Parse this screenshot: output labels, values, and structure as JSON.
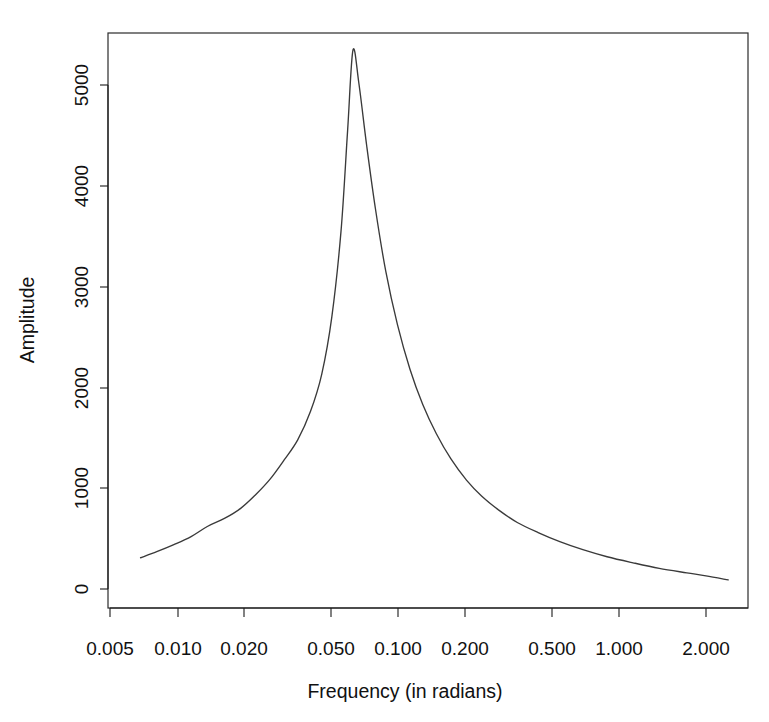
{
  "chart_data": {
    "type": "line",
    "title": "",
    "xlabel": "Frequency (in radians)",
    "ylabel": "Amplitude",
    "xscale": "log",
    "yscale": "linear",
    "grid": false,
    "legend": null,
    "xlim": [
      0.0045,
      2.6
    ],
    "ylim": [
      0,
      5400
    ],
    "xticks": [
      0.005,
      0.01,
      0.02,
      0.05,
      0.1,
      0.2,
      0.5,
      1.0,
      2.0
    ],
    "xticklabels": [
      "0.005",
      "0.010",
      "0.020",
      "0.050",
      "0.100",
      "0.200",
      "0.500",
      "1.000",
      "2.000"
    ],
    "yticks": [
      0,
      1000,
      2000,
      3000,
      4000,
      5000
    ],
    "yticklabels": [
      "0",
      "1000",
      "2000",
      "3000",
      "4000",
      "5000"
    ],
    "series": [
      {
        "name": "spectrum",
        "color": "#3a3a3a",
        "x": [
          0.0068,
          0.008,
          0.0095,
          0.0113,
          0.0133,
          0.0158,
          0.0186,
          0.0215,
          0.025,
          0.0288,
          0.033,
          0.0375,
          0.042,
          0.0465,
          0.051,
          0.0545,
          0.0575,
          0.061,
          0.066,
          0.072,
          0.08,
          0.09,
          0.102,
          0.116,
          0.133,
          0.154,
          0.18,
          0.21,
          0.25,
          0.3,
          0.37,
          0.46,
          0.58,
          0.74,
          0.96,
          1.25,
          1.65,
          2.0,
          2.5
        ],
        "y": [
          310,
          370,
          440,
          520,
          620,
          700,
          800,
          930,
          1090,
          1280,
          1480,
          1760,
          2130,
          2700,
          3550,
          4550,
          5345,
          5020,
          4400,
          3780,
          3150,
          2620,
          2180,
          1830,
          1540,
          1290,
          1080,
          920,
          780,
          660,
          560,
          470,
          390,
          320,
          260,
          205,
          160,
          130,
          90
        ]
      }
    ],
    "annotations": []
  },
  "axes": {
    "x_title": "Frequency (in radians)",
    "y_title": "Amplitude"
  },
  "header": {
    "title": ""
  }
}
